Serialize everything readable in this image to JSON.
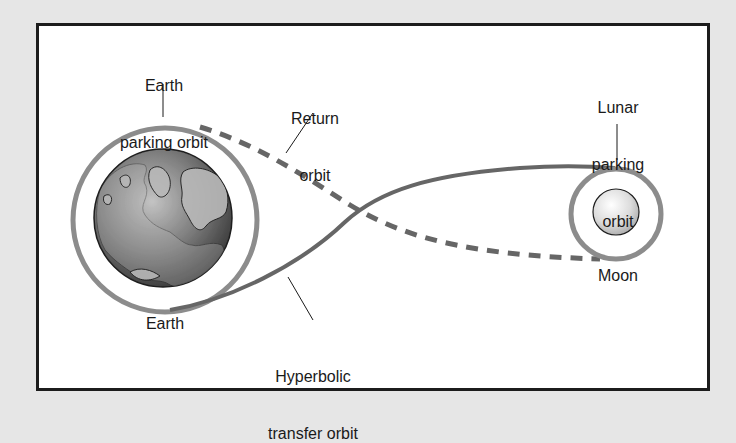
{
  "diagram": {
    "type": "orbital-trajectory",
    "colors": {
      "background": "#e6e6e6",
      "frame_fill": "#ffffff",
      "frame_border": "#1c1c1c",
      "parking_orbit": "#8c8c8c",
      "transfer_orbit": "#666666",
      "return_orbit": "#666666",
      "earth_dark": "#3a3a3a",
      "earth_light": "#bdbdbd",
      "moon": "#d8d8d8",
      "text": "#1a1a1a"
    },
    "labels": {
      "earth_parking_orbit_line1": "Earth",
      "earth_parking_orbit_line2": "parking orbit",
      "return_orbit_line1": "Return",
      "return_orbit_line2": "orbit",
      "lunar_parking_orbit_line1": "Lunar",
      "lunar_parking_orbit_line2": "parking",
      "lunar_parking_orbit_line3": "orbit",
      "earth": "Earth",
      "moon": "Moon",
      "hyperbolic_line1": "Hyperbolic",
      "hyperbolic_line2": "transfer orbit"
    },
    "bodies": [
      {
        "name": "Earth",
        "icon": "earth-globe-icon"
      },
      {
        "name": "Moon",
        "icon": "moon-sphere-icon"
      }
    ],
    "orbits": [
      {
        "name": "Earth parking orbit",
        "style": "solid-ring"
      },
      {
        "name": "Hyperbolic transfer orbit",
        "style": "solid-curve"
      },
      {
        "name": "Return orbit",
        "style": "dashed-curve"
      },
      {
        "name": "Lunar parking orbit",
        "style": "solid-ring"
      }
    ]
  }
}
